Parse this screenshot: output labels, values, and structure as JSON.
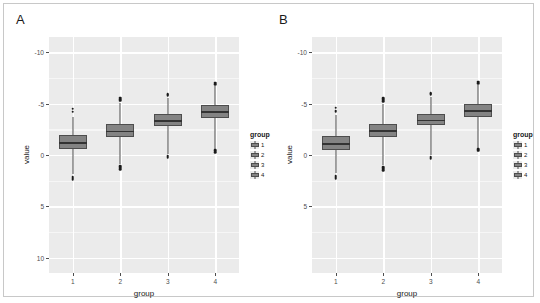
{
  "figure": {
    "panels": [
      {
        "tag": "A",
        "axis_title_x": "group",
        "axis_title_y": "value",
        "y_ticks": [
          "10",
          "5",
          "0",
          "-5",
          "-10"
        ],
        "y_tick_values": [
          10,
          5,
          0,
          -5,
          -10
        ],
        "x_ticks": [
          "1",
          "2",
          "3",
          "4"
        ],
        "legend": {
          "title": "group",
          "items": [
            "1",
            "2",
            "3",
            "4"
          ]
        }
      },
      {
        "tag": "B",
        "axis_title_x": "group",
        "axis_title_y": "value",
        "y_ticks": [
          "",
          "5",
          "0",
          "-5",
          "-10"
        ],
        "y_tick_values": [
          10,
          5,
          0,
          -5,
          -10
        ],
        "x_ticks": [
          "1",
          "2",
          "3",
          "4"
        ],
        "legend": {
          "title": "group",
          "items": [
            "1",
            "2",
            "3",
            "4"
          ]
        }
      }
    ]
  },
  "colors": {
    "panel_background": "#ebebeb",
    "gridline_major": "#ffffff",
    "box_fill": "#838383",
    "box_stroke": "#4d4d4d",
    "median": "#333333",
    "outlier": "#1a1a1a",
    "frame_border": "#c8c8c8",
    "text": "#1a1a1a",
    "axis_text": "#4d4d4d"
  },
  "chart_data": [
    {
      "type": "box",
      "panel": "A",
      "title": "A",
      "xlabel": "group",
      "ylabel": "value",
      "ylim": [
        -11.5,
        11.5
      ],
      "yticks": [
        -10,
        -5,
        0,
        5,
        10
      ],
      "grid": true,
      "legend": {
        "title": "group",
        "position": "right",
        "entries": [
          "1",
          "2",
          "3",
          "4"
        ]
      },
      "categories": [
        "1",
        "2",
        "3",
        "4"
      ],
      "boxes": [
        {
          "group": "1",
          "min": -1.9,
          "q1": 0.55,
          "median": 1.25,
          "q3": 1.95,
          "max": 3.7,
          "outliers": [
            4.5,
            4.2,
            -2.1,
            -2.2,
            -2.35
          ]
        },
        {
          "group": "2",
          "min": -0.9,
          "q1": 1.75,
          "median": 2.35,
          "q3": 3.0,
          "max": 5.1,
          "outliers": [
            5.3,
            5.45,
            5.6,
            -1.1,
            -1.25,
            -1.4
          ]
        },
        {
          "group": "3",
          "min": 0.05,
          "q1": 2.85,
          "median": 3.4,
          "q3": 3.95,
          "max": 5.6,
          "outliers": [
            5.8,
            5.95,
            -0.1,
            -0.25
          ]
        },
        {
          "group": "4",
          "min": 0.6,
          "q1": 3.65,
          "median": 4.25,
          "q3": 4.85,
          "max": 6.7,
          "outliers": [
            6.9,
            7.05,
            0.45,
            0.3
          ]
        }
      ]
    },
    {
      "type": "box",
      "panel": "B",
      "title": "B",
      "xlabel": "group",
      "ylabel": "value",
      "ylim": [
        -11.5,
        11.5
      ],
      "yticks": [
        -10,
        -5,
        0,
        5,
        10
      ],
      "grid": true,
      "legend": {
        "title": "group",
        "position": "right",
        "entries": [
          "1",
          "2",
          "3",
          "4"
        ]
      },
      "categories": [
        "1",
        "2",
        "3",
        "4"
      ],
      "boxes": [
        {
          "group": "1",
          "min": -1.8,
          "q1": 0.45,
          "median": 1.15,
          "q3": 1.85,
          "max": 3.9,
          "outliers": [
            4.6,
            4.25,
            -2.0,
            -2.15,
            -2.3
          ]
        },
        {
          "group": "2",
          "min": -1.0,
          "q1": 1.8,
          "median": 2.4,
          "q3": 3.05,
          "max": 5.0,
          "outliers": [
            5.25,
            5.4,
            5.55,
            -1.2,
            -1.35,
            -1.5
          ]
        },
        {
          "group": "3",
          "min": 0.0,
          "q1": 2.9,
          "median": 3.45,
          "q3": 4.0,
          "max": 5.7,
          "outliers": [
            5.9,
            6.05,
            -0.15,
            -0.3
          ]
        },
        {
          "group": "4",
          "min": 0.7,
          "q1": 3.75,
          "median": 4.35,
          "q3": 4.95,
          "max": 6.8,
          "outliers": [
            7.0,
            7.15,
            0.55,
            0.4
          ]
        }
      ]
    }
  ]
}
